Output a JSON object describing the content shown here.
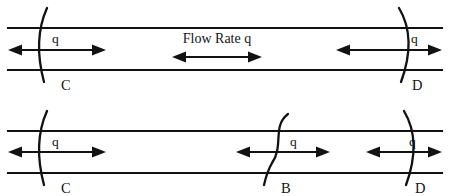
{
  "diagram": {
    "flow_rate_label": "Flow Rate q",
    "quantity_symbol": "q",
    "colors": {
      "line": "#121212",
      "background": "#ffffff"
    },
    "pipes": [
      {
        "id": "top-pipe",
        "top_wall_y": 28,
        "bottom_wall_y": 70,
        "x_start": 8,
        "x_end": 442,
        "boundaries": [
          {
            "id": "C",
            "label": "C",
            "x": 40,
            "q_label": "q",
            "bulge": "left"
          },
          {
            "id": "D",
            "label": "D",
            "x": 405,
            "q_label": "q",
            "bulge": "right"
          }
        ],
        "center_annotation": {
          "label": "Flow Rate q",
          "arrow_x_start": 172,
          "arrow_x_end": 262,
          "arrow_y": 57,
          "text_x": 217,
          "text_y": 42
        }
      },
      {
        "id": "bottom-pipe",
        "top_wall_y": 131,
        "bottom_wall_y": 173,
        "x_start": 8,
        "x_end": 442,
        "boundaries": [
          {
            "id": "C",
            "label": "C",
            "x": 40,
            "q_label": "q",
            "bulge": "left"
          },
          {
            "id": "B",
            "label": "B",
            "x": 280,
            "q_label": "q",
            "bulge": "s-curve"
          },
          {
            "id": "D",
            "label": "D",
            "x": 410,
            "q_label": "q",
            "bulge": "right"
          }
        ]
      }
    ],
    "point_labels": [
      "C",
      "D",
      "C",
      "B",
      "D"
    ],
    "q_labels": [
      "q",
      "q",
      "q",
      "q",
      "q"
    ]
  }
}
